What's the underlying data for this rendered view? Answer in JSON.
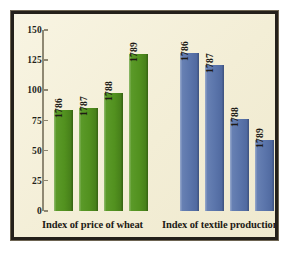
{
  "chart_data": {
    "type": "bar",
    "title": "",
    "xlabel": "",
    "ylabel": "",
    "ylim": [
      0,
      150
    ],
    "yticks": [
      0,
      25,
      50,
      75,
      100,
      125,
      150
    ],
    "grid": false,
    "legend": "none",
    "colors": {
      "wheat": "#52911f",
      "textile": "#5a74aa",
      "background": "#f7f2dc",
      "frame": "#24201a",
      "axis": "#8f8873",
      "text": "#1d1a15"
    },
    "groups": [
      {
        "name": "wheat",
        "caption": "Index of price of wheat",
        "color": "#52911f",
        "categories": [
          "1786",
          "1787",
          "1788",
          "1789"
        ],
        "values": [
          84,
          85,
          98,
          130
        ]
      },
      {
        "name": "textile",
        "caption": "Index of textile production",
        "color": "#5a74aa",
        "categories": [
          "1786",
          "1787",
          "1788",
          "1789"
        ],
        "values": [
          131,
          121,
          76,
          59
        ]
      }
    ]
  }
}
